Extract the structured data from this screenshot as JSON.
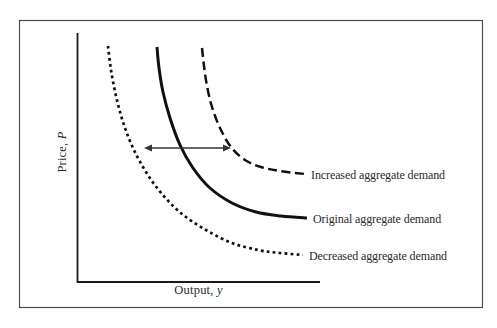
{
  "figure": {
    "ylabel": {
      "text": "Price,",
      "var": "P"
    },
    "xlabel": {
      "text": "Output,",
      "var": "y"
    }
  },
  "colors": {
    "curve": "#111111",
    "arrow": "#333333",
    "axis": "#1a1a1a",
    "frame": "#4d4d4d",
    "text": "#2b2b2b",
    "background": "#ffffff"
  },
  "chart_data": {
    "type": "line",
    "title": "",
    "xlabel": "Output, y",
    "ylabel": "Price, P",
    "axes": {
      "numeric": false,
      "ticks": "none",
      "x_axis_px": {
        "y": 282,
        "x1": 77,
        "x2": 320
      },
      "y_axis_px": {
        "x": 77,
        "y1": 33,
        "y2": 282
      }
    },
    "grid": false,
    "legend_position": "labels-at-curve-ends",
    "series": [
      {
        "name": "Increased aggregate demand",
        "line_style": "dashed",
        "points_px": [
          [
            202,
            48
          ],
          [
            204,
            66
          ],
          [
            207,
            86
          ],
          [
            212,
            107
          ],
          [
            220,
            128
          ],
          [
            231,
            147
          ],
          [
            245,
            160
          ],
          [
            261,
            167
          ],
          [
            280,
            171
          ],
          [
            305,
            174
          ]
        ]
      },
      {
        "name": "Original aggregate demand",
        "line_style": "solid",
        "points_px": [
          [
            157,
            47
          ],
          [
            159,
            68
          ],
          [
            163,
            92
          ],
          [
            170,
            118
          ],
          [
            180,
            145
          ],
          [
            193,
            168
          ],
          [
            210,
            188
          ],
          [
            232,
            203
          ],
          [
            256,
            212
          ],
          [
            281,
            216
          ],
          [
            307,
            218
          ]
        ]
      },
      {
        "name": "Decreased aggregate demand",
        "line_style": "dotted",
        "points_px": [
          [
            108,
            46
          ],
          [
            111,
            70
          ],
          [
            116,
            96
          ],
          [
            123,
            122
          ],
          [
            133,
            148
          ],
          [
            146,
            172
          ],
          [
            162,
            194
          ],
          [
            182,
            214
          ],
          [
            206,
            230
          ],
          [
            232,
            243
          ],
          [
            258,
            250
          ],
          [
            280,
            253
          ],
          [
            303,
            255
          ]
        ]
      }
    ],
    "annotations": {
      "shift_arrow": {
        "type": "double-headed-horizontal",
        "x1": 144,
        "y1": 148,
        "x2": 231,
        "y2": 148
      }
    }
  }
}
